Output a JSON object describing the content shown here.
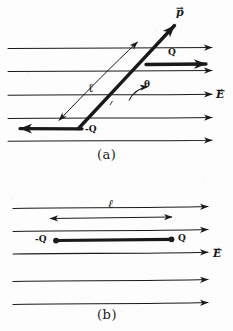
{
  "figure": {
    "title_absent": true,
    "background_color": "#fdfdfd",
    "ink_color": "#1a1a1a",
    "width": 233,
    "height": 331,
    "style": "hand-drawn pencil sketch"
  },
  "panel_a": {
    "caption": "(a)",
    "description": "Electric dipole tilted at angle theta in a uniform electric field",
    "field_label": "E",
    "field_vector_accent": "→",
    "field_lines": [
      {
        "y": 48,
        "direction": "right"
      },
      {
        "y": 71,
        "direction": "right"
      },
      {
        "y": 95,
        "direction": "right"
      },
      {
        "y": 118,
        "direction": "right"
      },
      {
        "y": 141,
        "direction": "right"
      }
    ],
    "dipole_moment_label": "p",
    "positive_charge_label": "Q",
    "negative_charge_label": "-Q",
    "separation_label": "ℓ",
    "angle_label": "θ",
    "force_on_positive": {
      "label": "Q",
      "direction": "right"
    },
    "force_on_negative": {
      "label": "-Q",
      "direction": "left"
    }
  },
  "panel_b": {
    "caption": "(b)",
    "description": "Electric dipole aligned parallel to a uniform electric field",
    "field_label": "E",
    "field_vector_accent": "→",
    "field_lines": [
      {
        "y": 207,
        "direction": "right"
      },
      {
        "y": 230,
        "direction": "right"
      },
      {
        "y": 253,
        "direction": "right"
      },
      {
        "y": 280,
        "direction": "right"
      },
      {
        "y": 303,
        "direction": "right"
      }
    ],
    "positive_charge_label": "Q",
    "negative_charge_label": "-Q",
    "separation_label": "ℓ",
    "dimension_arrow": "double-headed"
  }
}
